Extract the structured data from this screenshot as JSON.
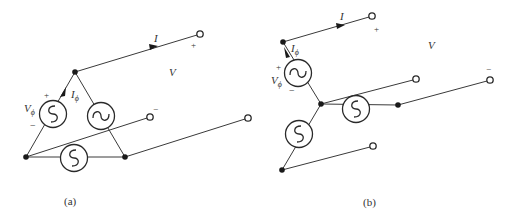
{
  "figure": {
    "panels": [
      {
        "id": "a",
        "caption": "(a)",
        "configuration": "delta",
        "labels": {
          "line_current": "I",
          "phase_current_main": "I",
          "phase_current_sub": "ϕ",
          "phase_voltage_main": "V",
          "phase_voltage_sub": "ϕ",
          "line_voltage": "V",
          "plus_phase": "+",
          "minus_phase": "−",
          "plus_line": "+",
          "minus_line": "−"
        }
      },
      {
        "id": "b",
        "caption": "(b)",
        "configuration": "wye",
        "labels": {
          "line_current": "I",
          "phase_current_main": "I",
          "phase_current_sub": "ϕ",
          "phase_voltage_main": "V",
          "phase_voltage_sub": "ϕ",
          "line_voltage": "V",
          "plus_phase": "+",
          "minus_phase": "−",
          "plus_line": "+",
          "minus_line": "−"
        }
      }
    ],
    "icons": {
      "source": "ac-voltage-source-icon",
      "node": "junction-dot-icon",
      "terminal": "open-terminal-icon"
    },
    "colors": {
      "line": "#3a3a3a",
      "node": "#1a1a1a",
      "background": "#ffffff"
    }
  }
}
